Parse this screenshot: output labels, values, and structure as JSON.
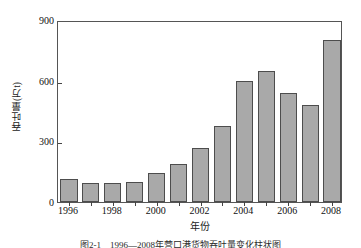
{
  "figure": {
    "caption": "图2-1　1996—2008年营口港货物吞吐量变化柱状图"
  },
  "chart_data": {
    "type": "bar",
    "title": "",
    "xlabel": "年份",
    "ylabel": "吞吐量(万t)",
    "categories": [
      "1996",
      "1997",
      "1998",
      "1999",
      "2000",
      "2001",
      "2002",
      "2003",
      "2004",
      "2005",
      "2006",
      "2007",
      "2008"
    ],
    "values": [
      115,
      95,
      92,
      97,
      145,
      188,
      268,
      375,
      600,
      650,
      540,
      480,
      800
    ],
    "ylim": [
      0,
      900
    ],
    "yticks": [
      0,
      300,
      600,
      900
    ],
    "ytick_labels": [
      "0",
      "300",
      "600",
      "900"
    ],
    "xtick_labels": [
      "1996",
      "1998",
      "2000",
      "2002",
      "2004",
      "2006",
      "2008"
    ],
    "xtick_categories": [
      "1996",
      "1998",
      "2000",
      "2002",
      "2004",
      "2006",
      "2008"
    ],
    "grid": false,
    "legend": "none",
    "bar_color": "#a9a9a9",
    "bar_edge_color": "#4d4d4d",
    "axis_color": "#555555"
  }
}
